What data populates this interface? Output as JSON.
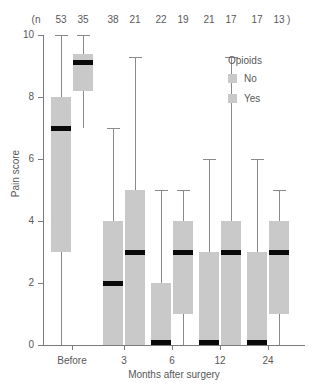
{
  "chart_data": {
    "type": "boxplot",
    "title": "",
    "xlabel": "Months after surgery",
    "ylabel": "Pain score",
    "ylim": [
      0,
      10
    ],
    "yticks": [
      0,
      2,
      4,
      6,
      8,
      10
    ],
    "ytick_labels": [
      "0",
      "2",
      "4",
      "6",
      "8",
      "10"
    ],
    "categories": [
      "Before",
      "3",
      "6",
      "12",
      "24"
    ],
    "grid": false,
    "legend": {
      "title": "Opioids",
      "position": "top-right",
      "entries": [
        {
          "label": "No",
          "color": "#c9c9c9"
        },
        {
          "label": "Yes",
          "color": "#c9c9c9"
        }
      ]
    },
    "n_row": {
      "prefix": "(n",
      "suffix": ")",
      "values": [
        53,
        35,
        38,
        21,
        22,
        19,
        21,
        17,
        17,
        13
      ]
    },
    "series": [
      {
        "name": "No",
        "boxes": [
          {
            "category": "Before",
            "n": 53,
            "whisker_low": 0,
            "q1": 3,
            "median": 7,
            "q3": 8,
            "whisker_high": 10
          },
          {
            "category": "3",
            "n": 38,
            "whisker_low": 0,
            "q1": 0,
            "median": 2,
            "q3": 4,
            "whisker_high": 7
          },
          {
            "category": "6",
            "n": 22,
            "whisker_low": 0,
            "q1": 0,
            "median": 0,
            "q3": 2,
            "whisker_high": 5
          },
          {
            "category": "12",
            "n": 21,
            "whisker_low": 0,
            "q1": 0,
            "median": 0,
            "q3": 3,
            "whisker_high": 6
          },
          {
            "category": "24",
            "n": 17,
            "whisker_low": 0,
            "q1": 0,
            "median": 0,
            "q3": 3,
            "whisker_high": 6
          }
        ]
      },
      {
        "name": "Yes",
        "boxes": [
          {
            "category": "Before",
            "n": 35,
            "whisker_low": 7,
            "q1": 8.2,
            "median": 9.1,
            "q3": 9.4,
            "whisker_high": 10
          },
          {
            "category": "3",
            "n": 21,
            "whisker_low": 0,
            "q1": 0,
            "median": 3,
            "q3": 5,
            "whisker_high": 9.3
          },
          {
            "category": "6",
            "n": 19,
            "whisker_low": 0,
            "q1": 1,
            "median": 3,
            "q3": 4,
            "whisker_high": 5
          },
          {
            "category": "12",
            "n": 17,
            "whisker_low": 0,
            "q1": 0,
            "median": 3,
            "q3": 4,
            "whisker_high": 9.3
          },
          {
            "category": "24",
            "n": 13,
            "whisker_low": 0,
            "q1": 1,
            "median": 3,
            "q3": 4,
            "whisker_high": 5
          }
        ]
      }
    ]
  }
}
